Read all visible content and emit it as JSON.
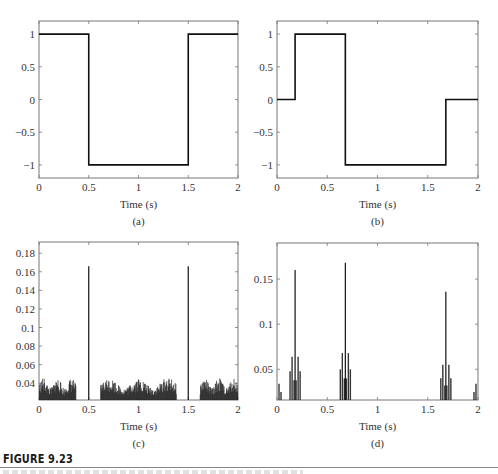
{
  "figure": {
    "title": "FIGURE 9.23"
  },
  "panels": [
    {
      "id": "a",
      "label": "(a)",
      "xlabel": "Time (s)"
    },
    {
      "id": "b",
      "label": "(b)",
      "xlabel": "Time (s)"
    },
    {
      "id": "c",
      "label": "(c)",
      "xlabel": "Time (s)"
    },
    {
      "id": "d",
      "label": "(d)",
      "xlabel": "Time (s)"
    }
  ],
  "chart_data": [
    {
      "panel": "(a)",
      "type": "line",
      "title": "",
      "xlabel": "Time (s)",
      "ylabel": "",
      "xlim": [
        0,
        2
      ],
      "ylim": [
        -1.2,
        1.2
      ],
      "xticks": [
        "0",
        "0.5",
        "1",
        "1.5",
        "2"
      ],
      "yticks": [
        "-1",
        "-0.5",
        "0",
        "0.5",
        "1"
      ],
      "grid": false,
      "x": [
        0,
        0.5,
        0.5,
        1.5,
        1.5,
        2
      ],
      "y": [
        1,
        1,
        -1,
        -1,
        1,
        1
      ]
    },
    {
      "panel": "(b)",
      "type": "line",
      "title": "",
      "xlabel": "Time (s)",
      "ylabel": "",
      "xlim": [
        0,
        2
      ],
      "ylim": [
        -1.2,
        1.2
      ],
      "xticks": [
        "0",
        "0.5",
        "1",
        "1.5",
        "2"
      ],
      "yticks": [
        "-1",
        "-0.5",
        "0",
        "0.5",
        "1"
      ],
      "grid": false,
      "x": [
        0,
        0.18,
        0.18,
        0.68,
        0.68,
        1.68,
        1.68,
        2
      ],
      "y": [
        0,
        0,
        1,
        1,
        -1,
        -1,
        0,
        0
      ]
    },
    {
      "panel": "(c)",
      "type": "bar",
      "title": "",
      "xlabel": "Time (s)",
      "ylabel": "",
      "xlim": [
        0,
        2
      ],
      "ylim": [
        0.022,
        0.192
      ],
      "xticks": [
        "0",
        "0.5",
        "1",
        "1.5",
        "2"
      ],
      "yticks": [
        "0.04",
        "0.06",
        "0.08",
        "0.1",
        "0.12",
        "0.14",
        "0.16",
        "0.18"
      ],
      "grid": false,
      "peaks": [
        {
          "x": 0.5,
          "y": 0.166
        },
        {
          "x": 1.5,
          "y": 0.166
        }
      ],
      "noise_bands": [
        {
          "x_start": 0.0,
          "x_end": 0.37,
          "max": 0.046
        },
        {
          "x_start": 0.62,
          "x_end": 1.38,
          "max": 0.046
        },
        {
          "x_start": 1.62,
          "x_end": 2.0,
          "max": 0.046
        }
      ]
    },
    {
      "panel": "(d)",
      "type": "bar",
      "title": "",
      "xlabel": "Time (s)",
      "ylabel": "",
      "xlim": [
        0,
        2
      ],
      "ylim": [
        0.016,
        0.19
      ],
      "xticks": [
        "0",
        "0.5",
        "1",
        "1.5",
        "2"
      ],
      "yticks": [
        "0.05",
        "0.1",
        "0.15"
      ],
      "grid": false,
      "peaks": [
        {
          "x": 0.18,
          "y": 0.16
        },
        {
          "x": 0.68,
          "y": 0.168
        },
        {
          "x": 1.68,
          "y": 0.136
        }
      ],
      "side_lobes": [
        {
          "x": 0.02,
          "y": 0.034
        },
        {
          "x": 0.04,
          "y": 0.025
        },
        {
          "x": 0.13,
          "y": 0.048
        },
        {
          "x": 0.15,
          "y": 0.064
        },
        {
          "x": 0.17,
          "y": 0.038
        },
        {
          "x": 0.19,
          "y": 0.038
        },
        {
          "x": 0.21,
          "y": 0.064
        },
        {
          "x": 0.23,
          "y": 0.048
        },
        {
          "x": 0.63,
          "y": 0.05
        },
        {
          "x": 0.65,
          "y": 0.068
        },
        {
          "x": 0.67,
          "y": 0.04
        },
        {
          "x": 0.69,
          "y": 0.04
        },
        {
          "x": 0.71,
          "y": 0.068
        },
        {
          "x": 0.73,
          "y": 0.05
        },
        {
          "x": 1.63,
          "y": 0.04
        },
        {
          "x": 1.65,
          "y": 0.055
        },
        {
          "x": 1.67,
          "y": 0.032
        },
        {
          "x": 1.69,
          "y": 0.032
        },
        {
          "x": 1.71,
          "y": 0.055
        },
        {
          "x": 1.73,
          "y": 0.04
        },
        {
          "x": 1.96,
          "y": 0.025
        },
        {
          "x": 1.98,
          "y": 0.034
        }
      ]
    }
  ]
}
